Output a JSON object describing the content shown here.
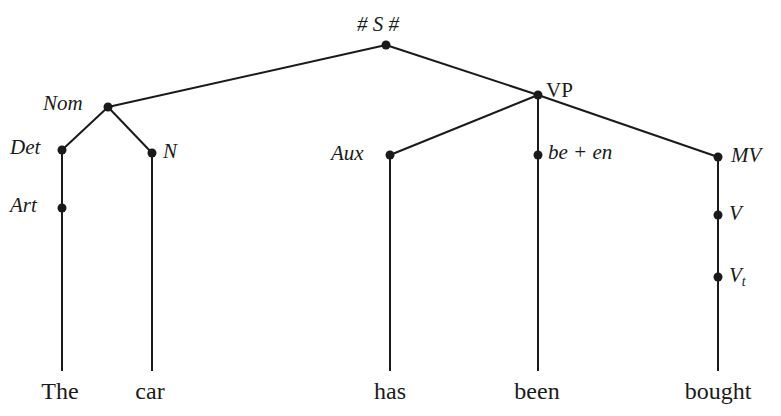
{
  "diagram": {
    "type": "phrase-structure-tree",
    "root": {
      "label": "# S #"
    },
    "nodes": {
      "nom": "Nom",
      "vp": "VP",
      "det": "Det",
      "n": "N",
      "art": "Art",
      "aux": "Aux",
      "be_en": "be + en",
      "mv": "MV",
      "v": "V",
      "vt_base": "V",
      "vt_sub": "t"
    },
    "edges": [
      [
        "# S #",
        "Nom"
      ],
      [
        "# S #",
        "VP"
      ],
      [
        "Nom",
        "Det"
      ],
      [
        "Nom",
        "N"
      ],
      [
        "Det",
        "Art"
      ],
      [
        "Art",
        "The"
      ],
      [
        "N",
        "car"
      ],
      [
        "VP",
        "Aux"
      ],
      [
        "VP",
        "be + en"
      ],
      [
        "VP",
        "MV"
      ],
      [
        "Aux",
        "has"
      ],
      [
        "be + en",
        "been"
      ],
      [
        "MV",
        "V"
      ],
      [
        "V",
        "Vt"
      ],
      [
        "Vt",
        "bought"
      ]
    ],
    "words": {
      "w1": "The",
      "w2": "car",
      "w3": "has",
      "w4": "been",
      "w5": "bought"
    },
    "colors": {
      "ink": "#1a1a1a",
      "background": "#ffffff"
    }
  }
}
